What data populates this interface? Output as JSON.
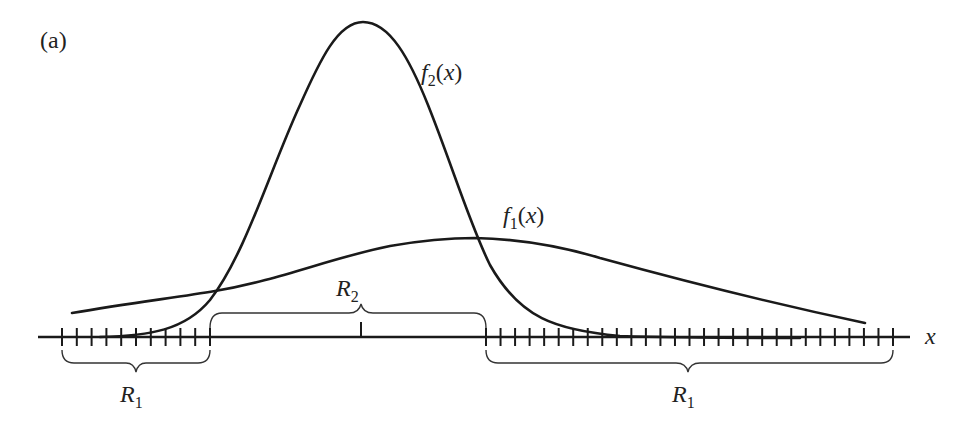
{
  "figure": {
    "panel_label": "(a)",
    "axis_label": "x",
    "curves": [
      {
        "name": "f2",
        "base": "f",
        "sub": "2",
        "arg": "(x)",
        "description": "narrow tall density"
      },
      {
        "name": "f1",
        "base": "f",
        "sub": "1",
        "arg": "(x)",
        "description": "wide flat density"
      }
    ],
    "regions": [
      {
        "name": "R1-left",
        "base": "R",
        "sub": "1"
      },
      {
        "name": "R2",
        "base": "R",
        "sub": "2"
      },
      {
        "name": "R1-right",
        "base": "R",
        "sub": "1"
      }
    ],
    "colors": {
      "ink": "#1a1a1a",
      "background": "#ffffff"
    }
  }
}
